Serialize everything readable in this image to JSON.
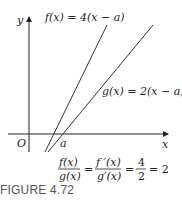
{
  "figure": {
    "caption": "FIGURE 4.72",
    "axes": {
      "x_label": "x",
      "y_label": "y",
      "origin_label": "O",
      "point_label": "a"
    },
    "lines": [
      {
        "name": "f",
        "label": "f(x) = 4(x − a)",
        "slope": 4
      },
      {
        "name": "g",
        "label": "g(x) = 2(x − a)",
        "slope": 2
      }
    ],
    "equation": {
      "frac1_num": "f(x)",
      "frac1_den": "g(x)",
      "eq1": "=",
      "frac2_num": "f ′(x)",
      "frac2_den": "g′(x)",
      "eq2": "=",
      "frac3_num": "4",
      "frac3_den": "2",
      "result": "= 2"
    }
  }
}
